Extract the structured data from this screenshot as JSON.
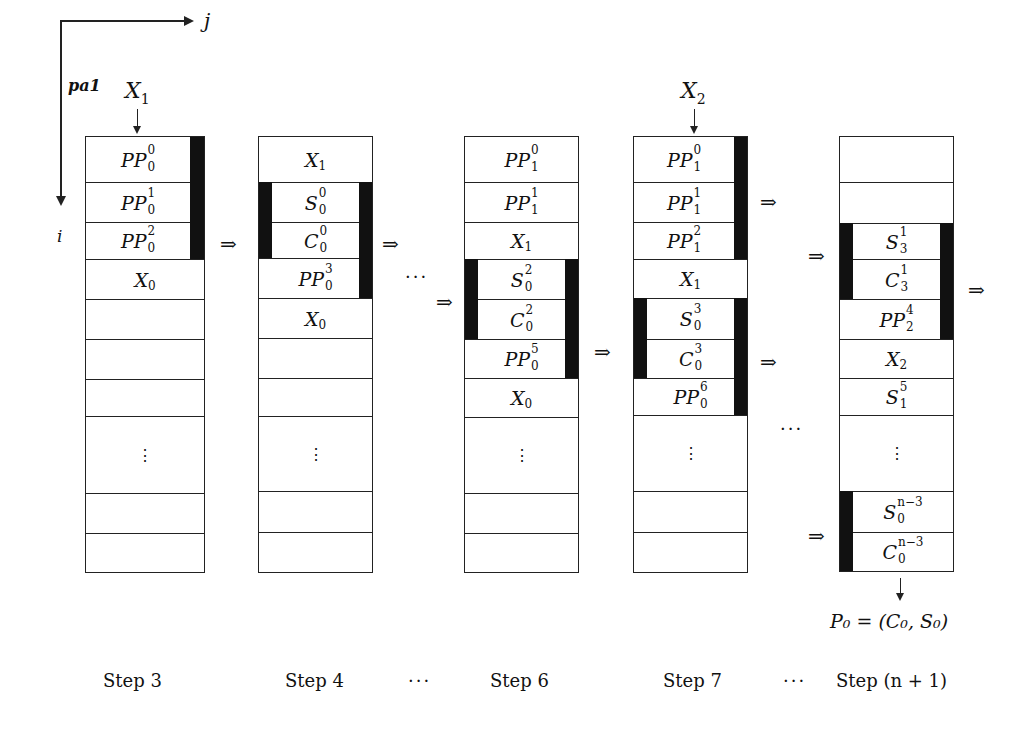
{
  "axes": {
    "j_label": "j",
    "i_label": "i",
    "pa_label": "pa1"
  },
  "inputs": [
    {
      "name": "X",
      "sub": "1",
      "column": 0
    },
    {
      "name": "X",
      "sub": "2",
      "column": 3
    }
  ],
  "columns": [
    {
      "step_label": "Step 3",
      "cells": [
        {
          "base": "PP",
          "sup": "0",
          "sub": "0"
        },
        {
          "base": "PP",
          "sup": "1",
          "sub": "0"
        },
        {
          "base": "PP",
          "sup": "2",
          "sub": "0"
        },
        {
          "base": "X",
          "sup": "",
          "sub": "0"
        },
        {
          "base": "",
          "sup": "",
          "sub": ""
        },
        {
          "base": "",
          "sup": "",
          "sub": ""
        },
        {
          "base": "",
          "sup": "",
          "sub": ""
        },
        {
          "base": "⋮",
          "sup": "",
          "sub": "",
          "dots": true
        },
        {
          "base": "",
          "sup": "",
          "sub": ""
        },
        {
          "base": "",
          "sup": "",
          "sub": ""
        }
      ]
    },
    {
      "step_label": "Step 4",
      "cells": [
        {
          "base": "X",
          "sup": "",
          "sub": "1"
        },
        {
          "base": "S",
          "sup": "0",
          "sub": "0"
        },
        {
          "base": "C",
          "sup": "0",
          "sub": "0"
        },
        {
          "base": "PP",
          "sup": "3",
          "sub": "0"
        },
        {
          "base": "X",
          "sup": "",
          "sub": "0"
        },
        {
          "base": "",
          "sup": "",
          "sub": ""
        },
        {
          "base": "",
          "sup": "",
          "sub": ""
        },
        {
          "base": "⋮",
          "sup": "",
          "sub": "",
          "dots": true
        },
        {
          "base": "",
          "sup": "",
          "sub": ""
        },
        {
          "base": "",
          "sup": "",
          "sub": ""
        }
      ]
    },
    {
      "step_label": "Step 6",
      "cells": [
        {
          "base": "PP",
          "sup": "0",
          "sub": "1"
        },
        {
          "base": "PP",
          "sup": "1",
          "sub": "1"
        },
        {
          "base": "X",
          "sup": "",
          "sub": "1"
        },
        {
          "base": "S",
          "sup": "2",
          "sub": "0"
        },
        {
          "base": "C",
          "sup": "2",
          "sub": "0"
        },
        {
          "base": "PP",
          "sup": "5",
          "sub": "0"
        },
        {
          "base": "X",
          "sup": "",
          "sub": "0"
        },
        {
          "base": "⋮",
          "sup": "",
          "sub": "",
          "dots": true
        },
        {
          "base": "",
          "sup": "",
          "sub": ""
        },
        {
          "base": "",
          "sup": "",
          "sub": ""
        }
      ]
    },
    {
      "step_label": "Step 7",
      "cells": [
        {
          "base": "PP",
          "sup": "0",
          "sub": "1"
        },
        {
          "base": "PP",
          "sup": "1",
          "sub": "1"
        },
        {
          "base": "PP",
          "sup": "2",
          "sub": "1"
        },
        {
          "base": "X",
          "sup": "",
          "sub": "1"
        },
        {
          "base": "S",
          "sup": "3",
          "sub": "0"
        },
        {
          "base": "C",
          "sup": "3",
          "sub": "0"
        },
        {
          "base": "PP",
          "sup": "6",
          "sub": "0"
        },
        {
          "base": "⋮",
          "sup": "",
          "sub": "",
          "dots": true
        },
        {
          "base": "",
          "sup": "",
          "sub": ""
        },
        {
          "base": "",
          "sup": "",
          "sub": ""
        }
      ]
    },
    {
      "step_label": "Step (n + 1)",
      "cells": [
        {
          "base": "",
          "sup": "",
          "sub": ""
        },
        {
          "base": "",
          "sup": "",
          "sub": ""
        },
        {
          "base": "S",
          "sup": "1",
          "sub": "3"
        },
        {
          "base": "C",
          "sup": "1",
          "sub": "3"
        },
        {
          "base": "PP",
          "sup": "4",
          "sub": "2"
        },
        {
          "base": "X",
          "sup": "",
          "sub": "2"
        },
        {
          "base": "S",
          "sup": "5",
          "sub": "1"
        },
        {
          "base": "⋮",
          "sup": "",
          "sub": "",
          "dots": true
        },
        {
          "base": "S",
          "sup": "n−3",
          "sub": "0"
        },
        {
          "base": "C",
          "sup": "n−3",
          "sub": "0"
        }
      ]
    }
  ],
  "separators": {
    "ellipsis": "···",
    "implies": "⇒"
  },
  "output": {
    "label": "P₀ = (C₀, S₀)"
  }
}
